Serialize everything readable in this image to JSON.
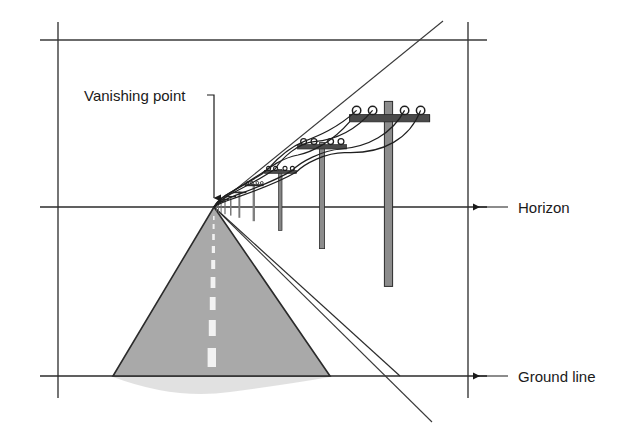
{
  "figure": {
    "background_color": "#ffffff",
    "line_color": "#3a3a3a",
    "road_fill_color": "#a9a9a9",
    "road_edge_color": "#2b2b2b",
    "pole_fill_color": "#8c8c8c",
    "pole_edge_color": "#2b2b2b",
    "center_line_color": "#f2f2f2",
    "wire_color": "#1f1f1f"
  },
  "labels": {
    "vanishing_point": "Vanishing point",
    "horizon": "Horizon",
    "ground_line": "Ground line"
  },
  "geometry": {
    "vanishing_point": {
      "x": 214,
      "y": 207
    },
    "horizon_line": {
      "y": 207,
      "x1": 58,
      "x2": 487
    },
    "ground_line": {
      "y": 376,
      "x1": 58,
      "x2": 487
    },
    "frame_top": {
      "y": 40,
      "x1": 40,
      "x2": 487
    },
    "frame_left": {
      "x": 58,
      "y1": 22,
      "y2": 398
    },
    "frame_right": {
      "x": 468,
      "y1": 22,
      "y2": 398
    },
    "upper_diagonal": {
      "x1": 214,
      "y1": 207,
      "x2": 443,
      "y2": 21
    },
    "lower_diagonal": {
      "x1": 214,
      "y1": 207,
      "x2": 432,
      "y2": 422
    },
    "road_left_base": {
      "x": 113,
      "y": 376
    },
    "road_right_base": {
      "x": 330,
      "y": 376
    },
    "pole_positions_x": [
      389,
      322,
      281,
      255,
      240,
      231,
      225,
      221,
      218,
      216
    ]
  },
  "callouts": {
    "vanishing_point_leader": {
      "text_x": 84,
      "text_y": 97,
      "elbow_x": 214,
      "arrow_y": 203
    },
    "horizon_leader": {
      "text_x": 516,
      "text_y": 213,
      "arrow_x": 470,
      "line_x": 506
    },
    "ground_line_leader": {
      "text_x": 516,
      "text_y": 382,
      "arrow_x": 470,
      "line_x": 506
    }
  }
}
